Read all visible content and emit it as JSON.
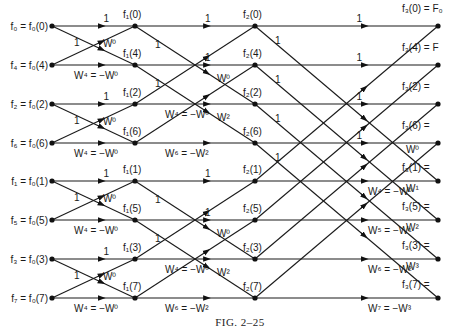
{
  "figure": {
    "caption": "FIG. 2–25",
    "rows_y": [
      26,
      65,
      104,
      143,
      181,
      220,
      259,
      298
    ],
    "stage_x": [
      52,
      135,
      255,
      438
    ],
    "input_labels": [
      "f₀ = f₀(0)",
      "f₄ = f₀(4)",
      "f₂ = f₀(2)",
      "f₆ = f₀(6)",
      "f₁ = f₀(1)",
      "f₅ = f₀(5)",
      "f₃ = f₀(3)",
      "f₇ = f₀(7)"
    ],
    "stage1_labels": [
      "f₁(0)",
      "f₁(4)",
      "f₁(2)",
      "f₁(6)",
      "f₁(1)",
      "f₁(5)",
      "f₁(3)",
      "f₁(7)"
    ],
    "stage2_labels": [
      "f₂(0)",
      "f₂(4)",
      "f₂(2)",
      "f₂(6)",
      "f₂(1)",
      "f₂(5)",
      "f₂(3)",
      "f₂(7)"
    ],
    "output_labels": [
      "f₃(0) = F₀",
      "f₃(4) = F",
      "f₃(2) =",
      "f₃(6) =",
      "f₃(1) =",
      "f₃(5) =",
      "f₃(3) =",
      "f₃(7) ="
    ],
    "stage1_weights": {
      "top_straight": "1",
      "top_cross": "1",
      "bottom_cross": "W⁰",
      "bottom_straight": "W⁴ = −W⁰"
    },
    "stage2_weights": {
      "straight": [
        "1",
        "1",
        "W⁴ = −W⁰",
        "W⁶ = −W²",
        "1",
        "1",
        "W⁴ = −W⁰",
        "W⁶ = −W²"
      ],
      "cross": [
        "1",
        "1",
        "W⁰",
        "W²",
        "1",
        "1",
        "W⁰",
        "W²"
      ]
    },
    "stage3_weights": {
      "straight": [
        "1",
        "1",
        "1",
        "1",
        "W⁴ = −W⁰",
        "W⁵ = −W¹",
        "W⁶ = −W²",
        "W⁷ = −W³"
      ],
      "cross": [
        "1",
        "1",
        "1",
        "1",
        "W⁰",
        "W¹",
        "W²",
        "W³"
      ]
    }
  }
}
